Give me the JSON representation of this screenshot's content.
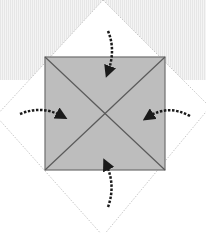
{
  "diagram": {
    "type": "origami-fold-step",
    "canvas": {
      "width": 206,
      "height": 233
    },
    "colors": {
      "background": "#ffffff",
      "top_band": "#ececec",
      "diamond_edge": "#c8c8c8",
      "square_fill": "#bdbdbd",
      "square_stroke": "#6e6e6e",
      "diagonal_stroke": "#5a5a5a",
      "arrow": "#1a1a1a"
    },
    "diamond": {
      "top": [
        103,
        0
      ],
      "right": [
        206,
        103
      ],
      "bottom": [
        103,
        233
      ],
      "left": [
        0,
        116
      ]
    },
    "square": {
      "x": 45,
      "y": 57,
      "width": 120,
      "height": 113
    },
    "arrows": [
      {
        "name": "top-arrow",
        "direction": "down"
      },
      {
        "name": "left-arrow",
        "direction": "right"
      },
      {
        "name": "right-arrow",
        "direction": "left"
      },
      {
        "name": "bottom-arrow",
        "direction": "up"
      }
    ]
  }
}
